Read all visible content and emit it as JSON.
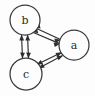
{
  "figure": {
    "type": "directed-graph-diagram",
    "background_color": "#fdfdfd",
    "stroke_color": "#2e2e2e",
    "node_fill_color": "#fdfdfd",
    "node_stroke_color": "#3a3a3a",
    "label_color": "#2b2b2b"
  },
  "nodes": [
    {
      "id": "b",
      "label": "b",
      "cx": 25,
      "cy": 20,
      "r": 15
    },
    {
      "id": "a",
      "label": "a",
      "cx": 74,
      "cy": 45,
      "r": 15
    },
    {
      "id": "c",
      "label": "c",
      "cx": 26,
      "cy": 74,
      "r": 16
    }
  ],
  "edges": [
    {
      "id": "b-c",
      "from": "b",
      "to": "c",
      "direction": "bidirectional",
      "parallel_lines": 2
    },
    {
      "id": "b-a",
      "from": "b",
      "to": "a",
      "direction": "bidirectional",
      "parallel_lines": 2
    },
    {
      "id": "c-a",
      "from": "c",
      "to": "a",
      "direction": "bidirectional",
      "parallel_lines": 2
    }
  ]
}
